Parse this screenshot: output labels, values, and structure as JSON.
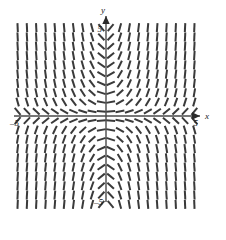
{
  "figure": {
    "title": "",
    "background_color": "#ffffff",
    "width": 226,
    "height": 219
  },
  "axes": {
    "x_axis_label": "x",
    "y_axis_label": "y",
    "x_tick_left_label": "–5",
    "x_tick_right_label": "5",
    "y_tick_top_label": "5",
    "y_tick_bottom_label": "–5",
    "axis_color": "#4a4a4a",
    "arrowheads": "both-positive-ends"
  },
  "chart_data": {
    "type": "scatter",
    "plot_kind": "slope-field",
    "title": "",
    "xlabel": "x",
    "ylabel": "y",
    "xlim": [
      -5,
      5
    ],
    "ylim": [
      -5,
      5
    ],
    "grid": false,
    "legend_position": "none",
    "slope_formula": "x*y",
    "segment_color": "#3a3a3a",
    "segment_length_px": 9,
    "segment_width_px": 2,
    "sample_x": [
      -4.75,
      -4.25,
      -3.75,
      -3.25,
      -2.75,
      -2.25,
      -1.75,
      -1.25,
      -0.75,
      -0.25,
      0.25,
      0.75,
      1.25,
      1.75,
      2.25,
      2.75,
      3.25,
      3.75,
      4.25,
      4.75
    ],
    "sample_y": [
      4.75,
      4.25,
      3.75,
      3.25,
      2.75,
      2.25,
      1.75,
      1.25,
      0.75,
      0.25,
      -0.25,
      -0.75,
      -1.25,
      -1.75,
      -2.25,
      -2.75,
      -3.25,
      -3.75,
      -4.25,
      -4.75
    ],
    "columns": 20,
    "rows": 20,
    "x_ticks": [
      -5,
      5
    ],
    "y_ticks": [
      -5,
      5
    ]
  }
}
